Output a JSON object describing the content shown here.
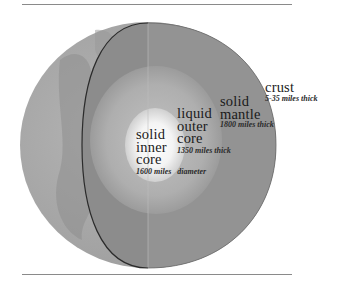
{
  "diagram": {
    "title": "",
    "type": "earth-cross-section",
    "colors": {
      "background": "#ffffff",
      "rule": "#8a8a8a",
      "outer_surface": "#a9a9a9",
      "surface_shadow": "#8f8f8f",
      "mantle": "#8c8c8c",
      "outer_core": "#b0b0b0",
      "inner_core": "#f2f2f2",
      "cut_outline": "#2b2b2b"
    },
    "layers": [
      {
        "id": "crust",
        "name_lines": [
          "crust"
        ],
        "detail": "5-35 miles thick"
      },
      {
        "id": "mantle",
        "name_lines": [
          "solid",
          "mantle"
        ],
        "detail": "1800 miles thick"
      },
      {
        "id": "outer_core",
        "name_lines": [
          "liquid",
          "outer",
          "core"
        ],
        "detail": "1350 miles thick"
      },
      {
        "id": "inner_core",
        "name_lines": [
          "solid",
          "inner",
          "core"
        ],
        "detail_a": "1600 miles",
        "detail_b": "diameter"
      }
    ]
  }
}
